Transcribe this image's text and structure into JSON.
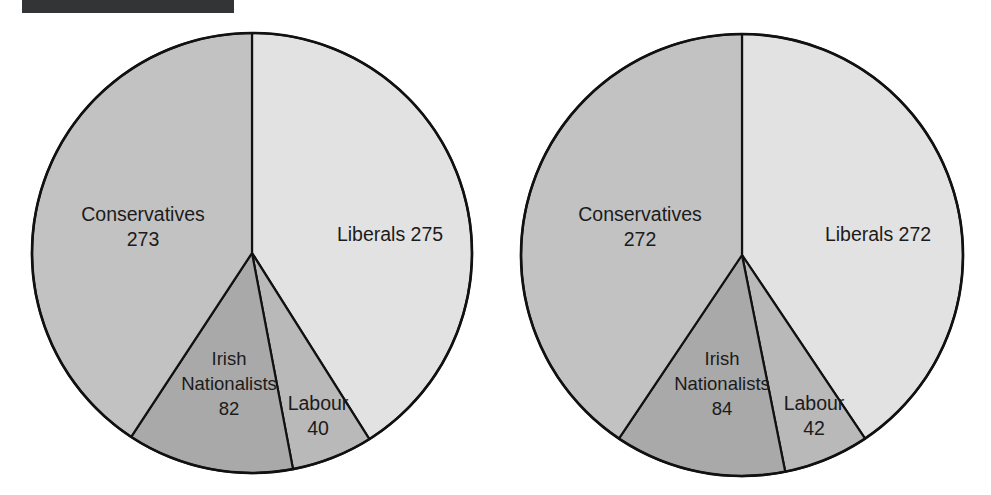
{
  "figure": {
    "redaction_bar_label": "redacted-caption-bar",
    "background_color": "#ffffff",
    "outline_color": "#111111"
  },
  "palette": {
    "Liberals": "#e2e2e2",
    "Conservatives": "#c2c2c2",
    "Irish Nationalists": "#a9a9a9",
    "Labour": "#b9b9b9"
  },
  "chart_data": [
    {
      "type": "pie",
      "title": "",
      "name": "pie-chart-left",
      "categories": [
        "Liberals",
        "Labour",
        "Irish Nationalists",
        "Conservatives"
      ],
      "values": [
        275,
        40,
        82,
        273
      ],
      "total": 670,
      "colors": [
        "#e2e2e2",
        "#b9b9b9",
        "#a9a9a9",
        "#c2c2c2"
      ],
      "start_angle_deg": 0,
      "direction": "clockwise",
      "geometry": {
        "cx": 252,
        "cy": 253,
        "r": 220
      },
      "labels": [
        {
          "key": "liberals",
          "name": "Liberals 275",
          "lines": [
            "Liberals 275"
          ],
          "x": 390,
          "y": 236
        },
        {
          "key": "conservatives",
          "name": "Conservatives 273",
          "lines": [
            "Conservatives",
            "273"
          ],
          "x": 143,
          "y": 228
        },
        {
          "key": "irish-nationalists",
          "name": "Irish Nationalists 82",
          "lines": [
            "Irish",
            "Nationalists",
            "82"
          ],
          "x": 229,
          "y": 385
        },
        {
          "key": "labour",
          "name": "Labour 40",
          "lines": [
            "Labour",
            "40"
          ],
          "x": 318,
          "y": 417
        }
      ]
    },
    {
      "type": "pie",
      "title": "",
      "name": "pie-chart-right",
      "categories": [
        "Liberals",
        "Labour",
        "Irish Nationalists",
        "Conservatives"
      ],
      "values": [
        272,
        42,
        84,
        272
      ],
      "total": 670,
      "colors": [
        "#e2e2e2",
        "#b9b9b9",
        "#a9a9a9",
        "#c2c2c2"
      ],
      "start_angle_deg": 0,
      "direction": "clockwise",
      "geometry": {
        "cx": 742,
        "cy": 255,
        "r": 221
      },
      "labels": [
        {
          "key": "liberals",
          "name": "Liberals 272",
          "lines": [
            "Liberals 272"
          ],
          "x": 878,
          "y": 236
        },
        {
          "key": "conservatives",
          "name": "Conservatives 272",
          "lines": [
            "Conservatives",
            "272"
          ],
          "x": 640,
          "y": 228
        },
        {
          "key": "irish-nationalists",
          "name": "Irish Nationalists 84",
          "lines": [
            "Irish",
            "Nationalists",
            "84"
          ],
          "x": 722,
          "y": 385
        },
        {
          "key": "labour",
          "name": "Labour 42",
          "lines": [
            "Labour",
            "42"
          ],
          "x": 814,
          "y": 417
        }
      ]
    }
  ]
}
